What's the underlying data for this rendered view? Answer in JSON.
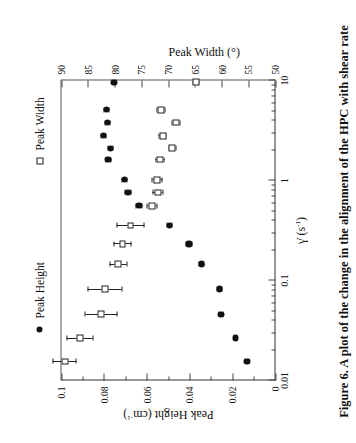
{
  "figure": {
    "caption": "Figure 6. A plot of the change in the alignment of the HPC with shear rate"
  },
  "legend": {
    "entries": [
      {
        "label": "Peak Width",
        "marker": "open-square-marker"
      },
      {
        "label": "Peak Height",
        "marker": "filled-circle-marker"
      }
    ]
  },
  "axes": {
    "x": {
      "label_main": "γ̇",
      "label_units": "(s",
      "label_exp": "-1",
      "label_close": ")",
      "label_full": "γ̇ (s⁻¹)",
      "scale": "log",
      "min": 0.01,
      "max": 10,
      "ticks": [
        "0.01",
        "0.1",
        "1",
        "10"
      ]
    },
    "y_left": {
      "label": "Peak Height (cm",
      "label_exp": "-1",
      "label_close": ")",
      "label_full": "Peak Height (cm⁻¹)",
      "min": 0,
      "max": 0.1,
      "ticks": [
        "0",
        "0.02",
        "0.04",
        "0.06",
        "0.08",
        "0.1"
      ]
    },
    "y_right": {
      "label_full": "Peak Width (°)",
      "min": 50,
      "max": 90,
      "ticks": [
        "50",
        "55",
        "60",
        "65",
        "70",
        "75",
        "80",
        "85",
        "90"
      ]
    }
  },
  "chart_data": {
    "type": "scatter",
    "title": "",
    "xlabel": "γ̇ (s⁻¹)",
    "ylabel": "Peak Height (cm⁻¹)",
    "y2label": "Peak Width (°)",
    "xscale": "log",
    "xlim": [
      0.01,
      10
    ],
    "ylim": [
      0,
      0.1
    ],
    "y2lim": [
      50,
      90
    ],
    "grid": false,
    "legend_position": "outside-left",
    "series": [
      {
        "name": "Peak Height",
        "marker": "filled-circle",
        "axis": "left",
        "unit": "cm^-1",
        "points": [
          {
            "x": 0.0155,
            "y": 0.0133,
            "yerr": 0.0008
          },
          {
            "x": 0.0265,
            "y": 0.0188,
            "yerr": 0.0008
          },
          {
            "x": 0.046,
            "y": 0.0255,
            "yerr": 0.001
          },
          {
            "x": 0.082,
            "y": 0.0262,
            "yerr": 0.001
          },
          {
            "x": 0.146,
            "y": 0.0345,
            "yerr": 0.0012
          },
          {
            "x": 0.232,
            "y": 0.0404,
            "yerr": 0.0012
          },
          {
            "x": 0.355,
            "y": 0.0495,
            "yerr": 0.0013
          },
          {
            "x": 0.56,
            "y": 0.0638,
            "yerr": 0.0013
          },
          {
            "x": 0.76,
            "y": 0.069,
            "yerr": 0.0013
          },
          {
            "x": 1.02,
            "y": 0.0705,
            "yerr": 0.0013
          },
          {
            "x": 1.62,
            "y": 0.0782,
            "yerr": 0.0012
          },
          {
            "x": 2.1,
            "y": 0.077,
            "yerr": 0.0012
          },
          {
            "x": 2.8,
            "y": 0.0805,
            "yerr": 0.0012
          },
          {
            "x": 3.8,
            "y": 0.0785,
            "yerr": 0.0012
          },
          {
            "x": 5.1,
            "y": 0.079,
            "yerr": 0.0012
          },
          {
            "x": 9.6,
            "y": 0.0755,
            "yerr": 0.001
          }
        ]
      },
      {
        "name": "Peak Width",
        "marker": "open-square",
        "axis": "right",
        "unit": "deg",
        "points": [
          {
            "x": 0.0155,
            "y": 89.4,
            "yerr": 2.2
          },
          {
            "x": 0.0265,
            "y": 86.6,
            "yerr": 2.4
          },
          {
            "x": 0.046,
            "y": 82.6,
            "yerr": 3.0
          },
          {
            "x": 0.082,
            "y": 81.9,
            "yerr": 3.2
          },
          {
            "x": 0.146,
            "y": 79.4,
            "yerr": 1.6
          },
          {
            "x": 0.232,
            "y": 78.6,
            "yerr": 1.6
          },
          {
            "x": 0.355,
            "y": 77.1,
            "yerr": 2.6
          },
          {
            "x": 0.56,
            "y": 73.1,
            "yerr": 0.9
          },
          {
            "x": 0.76,
            "y": 72.0,
            "yerr": 0.9
          },
          {
            "x": 1.02,
            "y": 72.1,
            "yerr": 0.9
          },
          {
            "x": 1.62,
            "y": 71.6,
            "yerr": 0.8
          },
          {
            "x": 2.1,
            "y": 69.3,
            "yerr": 0.7
          },
          {
            "x": 2.8,
            "y": 71.1,
            "yerr": 0.7
          },
          {
            "x": 3.8,
            "y": 68.6,
            "yerr": 0.7
          },
          {
            "x": 5.1,
            "y": 71.4,
            "yerr": 0.7
          },
          {
            "x": 9.6,
            "y": 64.9,
            "yerr": 0.6
          }
        ]
      }
    ]
  }
}
